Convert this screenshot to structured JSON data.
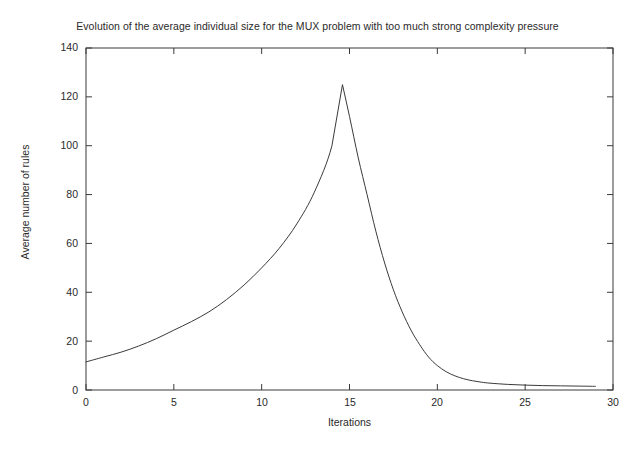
{
  "chart_data": {
    "type": "line",
    "title": "Evolution of the average individual size for the MUX problem with too much strong complexity pressure",
    "xlabel": "Iterations",
    "ylabel": "Average number of rules",
    "xlim": [
      0,
      30
    ],
    "ylim": [
      0,
      140
    ],
    "xticks": [
      0,
      5,
      10,
      15,
      20,
      25,
      30
    ],
    "xtick_labels": [
      "0",
      "5",
      "10",
      "15",
      "20",
      "25",
      "30"
    ],
    "yticks": [
      0,
      20,
      40,
      60,
      80,
      100,
      120,
      140
    ],
    "ytick_labels": [
      "0",
      "20",
      "40",
      "60",
      "80",
      "100",
      "120",
      "140"
    ],
    "grid": false,
    "legend": null,
    "line_color": "#3a3a3a",
    "line_width": 1,
    "series": [
      {
        "name": "average individual size",
        "x": [
          0,
          1,
          2,
          3,
          4,
          5,
          6,
          7,
          8,
          9,
          10,
          11,
          12,
          13,
          14,
          14.6,
          15,
          15.5,
          16,
          16.5,
          17,
          17.5,
          18,
          18.5,
          19,
          19.5,
          20,
          20.5,
          21,
          21.5,
          22,
          22.5,
          23,
          24,
          25,
          26,
          27,
          28,
          29
        ],
        "values": [
          11.5,
          13.5,
          15.5,
          18,
          21,
          24.5,
          28,
          32,
          37,
          43,
          50,
          58,
          68,
          81,
          100,
          125,
          112,
          95,
          80,
          65,
          52,
          41,
          32,
          24.5,
          18.5,
          13.5,
          10,
          7.5,
          5.8,
          4.6,
          3.8,
          3.2,
          2.8,
          2.3,
          2.0,
          1.8,
          1.7,
          1.6,
          1.5
        ]
      }
    ]
  },
  "axes": {
    "ytick_labels": [
      "140",
      "120",
      "100",
      "80",
      "60",
      "40",
      "20",
      "0"
    ],
    "xtick_labels": [
      "0",
      "5",
      "10",
      "15",
      "20",
      "25",
      "30"
    ]
  }
}
